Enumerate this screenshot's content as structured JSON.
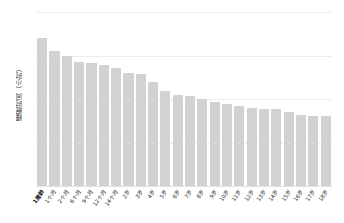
{
  "chart_data": {
    "type": "bar",
    "title": "",
    "subtitle": "",
    "xlabel": "",
    "ylabel": "睡眠时间（小时）",
    "ylim": [
      0,
      20
    ],
    "yticks": [
      "0",
      "5",
      "10",
      "15",
      "20"
    ],
    "ytick_values": [
      0,
      5,
      10,
      15,
      20
    ],
    "grid": true,
    "legend": null,
    "bar_color": "#d2d2d2",
    "categories": [
      "1周龄",
      "1个月",
      "2个月",
      "6个月",
      "9个月",
      "12个月",
      "14个月",
      "2岁",
      "3岁",
      "4岁",
      "5岁",
      "6岁",
      "7岁",
      "8岁",
      "9岁",
      "10岁",
      "11岁",
      "12岁",
      "13岁",
      "14岁",
      "15岁",
      "16岁",
      "17岁",
      "18岁"
    ],
    "values": [
      17.0,
      15.5,
      15.0,
      14.3,
      14.1,
      13.9,
      13.6,
      13.0,
      12.9,
      11.9,
      10.9,
      10.5,
      10.3,
      10.0,
      9.7,
      9.4,
      9.2,
      9.0,
      8.9,
      8.8,
      8.5,
      8.2,
      8.1,
      8.1
    ]
  },
  "axis": {
    "y_title": "睡眠时间（小时）"
  }
}
